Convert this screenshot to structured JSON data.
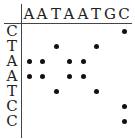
{
  "columns": [
    "A",
    "A",
    "T",
    "A",
    "A",
    "T",
    "G",
    "C"
  ],
  "rows": [
    "C",
    "T",
    "A",
    "A",
    "T",
    "C",
    "C"
  ],
  "matches": [
    {
      "row": 0,
      "col": 7
    },
    {
      "row": 1,
      "col": 2
    },
    {
      "row": 1,
      "col": 5
    },
    {
      "row": 2,
      "col": 0
    },
    {
      "row": 2,
      "col": 1
    },
    {
      "row": 2,
      "col": 3
    },
    {
      "row": 2,
      "col": 4
    },
    {
      "row": 3,
      "col": 0
    },
    {
      "row": 3,
      "col": 1
    },
    {
      "row": 3,
      "col": 3
    },
    {
      "row": 3,
      "col": 4
    },
    {
      "row": 4,
      "col": 2
    },
    {
      "row": 4,
      "col": 5
    },
    {
      "row": 5,
      "col": 7
    },
    {
      "row": 6,
      "col": 7
    }
  ]
}
